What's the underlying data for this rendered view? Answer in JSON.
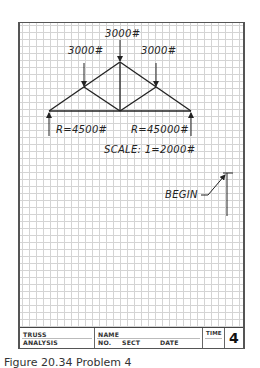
{
  "drawing": {
    "loads": [
      {
        "label": "3000#",
        "position": "apex"
      },
      {
        "label": "3000#",
        "position": "left-panel-point"
      },
      {
        "label": "3000#",
        "position": "right-panel-point"
      }
    ],
    "reactions": [
      {
        "label": "R=4500#",
        "position": "left-support"
      },
      {
        "label": "R=45000#",
        "position": "right-support"
      }
    ],
    "scale_label": "SCALE:  1=2000#",
    "begin_label": "BEGIN"
  },
  "title_block": {
    "title_line1": "TRUSS",
    "title_line2": "ANALYSIS",
    "name_label": "NAME",
    "no_label": "NO.",
    "sect_label": "SECT",
    "date_label": "DATE",
    "time_label": "TIME",
    "problem_number": "4"
  },
  "caption": "Figure 20.34 Problem 4"
}
